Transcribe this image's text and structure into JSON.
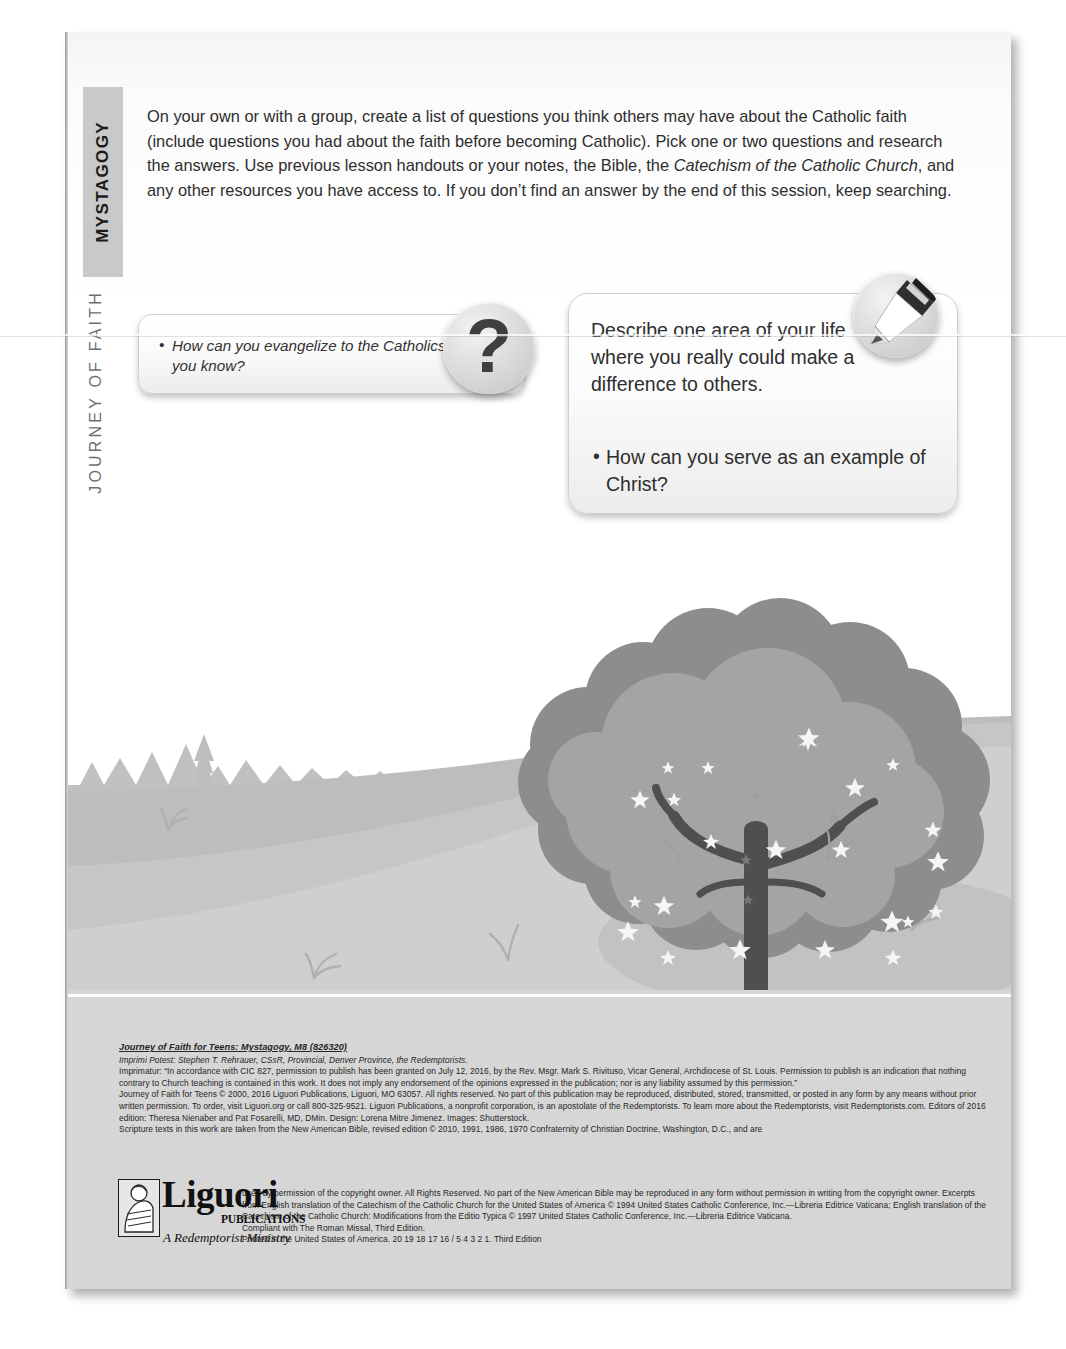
{
  "sidebar": {
    "section_tab": "MYSTAGOGY",
    "series_label": "JOURNEY OF FAITH"
  },
  "main": {
    "intro_paragraph_part1": "On your own or with a group, create a list of questions you think others may have about the Catholic faith (include questions you had about the faith before becoming Catholic). Pick one or two questions and research the answers. Use previous lesson handouts or your notes, the Bible, the ",
    "intro_italic_1": "Catechism of the Catholic Church",
    "intro_paragraph_part2": ", and any other resources you have access to. If you don’t find an answer by the end of this session, keep searching."
  },
  "callouts": {
    "left": {
      "icon": "question-mark-icon",
      "icon_glyph": "?",
      "bullet": "How can you evangelize to the Catholics you know?"
    },
    "right": {
      "icon": "pen-nib-icon",
      "heading": "Describe one area of your life where you really could make a difference to others.",
      "bullet": "How can you serve as an example of Christ?"
    }
  },
  "illustration": {
    "name": "flowering-tree-landscape",
    "elements": [
      "rolling-hill",
      "pine-tree-treeline",
      "flowering-tree",
      "grass-tufts"
    ],
    "colors": {
      "sky": "#ffffff",
      "far_hill": "#c3c3c3",
      "near_hill": "#b6b6b6",
      "foreground_hill": "#d2d2d2",
      "canopy_light": "#9a9a9a",
      "canopy_dark": "#7c7c7c",
      "trunk": "#4b4b4b",
      "blossom": "#f2f2f2"
    }
  },
  "footer": {
    "title": "Journey of Faith for Teens: Mystagogy, M8 (826320)",
    "lines_block_a": [
      "Imprimi Potest: Stephen T. Rehrauer, CSsR, Provincial, Denver Province, the Redemptorists.",
      "Imprimatur: “In accordance with CIC 827, permission to publish has been granted on July 12, 2016, by the Rev. Msgr. Mark S. Rivituso, Vicar General, Archdiocese of St. Louis. Permission to publish is an indication that nothing contrary to Church teaching is contained in this work. It does not imply any endorsement of the opinions expressed in the publication; nor is any liability assumed by this permission.”",
      "Journey of Faith for Teens © 2000, 2016 Liguori Publications, Liguori, MO 63057. All rights reserved. No part of this publication may be reproduced, distributed, stored, transmitted, or posted in any form by any means without prior written permission. To order, visit Liguori.org or call 800-325-9521. Liguori Publications, a nonprofit corporation, is an apostolate of the Redemptorists. To learn more about the Redemptorists, visit Redemptorists.com. Editors of 2016 edition: Theresa Nienaber and Pat Fosarelli, MD, DMin. Design: Lorena Mitre Jimenez. Images: Shutterstock.",
      "Scripture texts in this work are taken from the New American Bible, revised edition © 2010, 1991, 1986, 1970 Confraternity of Christian Doctrine, Washington, D.C., and are"
    ],
    "lines_block_b": [
      "used by permission of the copyright owner. All Rights Reserved. No part of the New American Bible may be reproduced in any form without permission in writing from the copyright owner. Excerpts from English translation of the Catechism of the Catholic Church for the United States of America © 1994 United States Catholic Conference, Inc.—Libreria Editrice Vaticana; English translation of the Catechism of the Catholic Church: Modifications from the Editio Typica © 1997 United States Catholic Conference, Inc.—Libreria Editrice Vaticana.",
      "Compliant with The Roman Missal, Third Edition.",
      "Printed in the United States of America. 20 19 18 17 16 / 5 4 3 2 1. Third Edition"
    ],
    "logo": {
      "wordmark": "Liguori",
      "sub": "PUBLICATIONS",
      "tagline": "A Redemptorist Ministry"
    }
  }
}
